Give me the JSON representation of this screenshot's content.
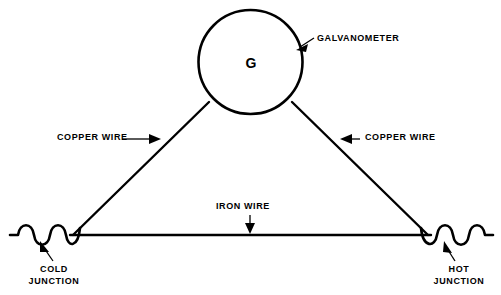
{
  "diagram": {
    "background_color": "#ffffff",
    "line_color": "#000000",
    "galvanometer": {
      "symbol": "G",
      "label": "GALVANOMETER",
      "circle": {
        "cx": 250.5,
        "cy": 62,
        "r": 52
      }
    },
    "wires": {
      "copper_left_label": "COPPER WIRE",
      "copper_right_label": "COPPER WIRE",
      "iron_label": "IRON WIRE"
    },
    "junctions": {
      "cold_line_1": "COLD",
      "cold_line_2": "JUNCTION",
      "hot_line_1": "HOT",
      "hot_line_2": "JUNCTION"
    }
  }
}
